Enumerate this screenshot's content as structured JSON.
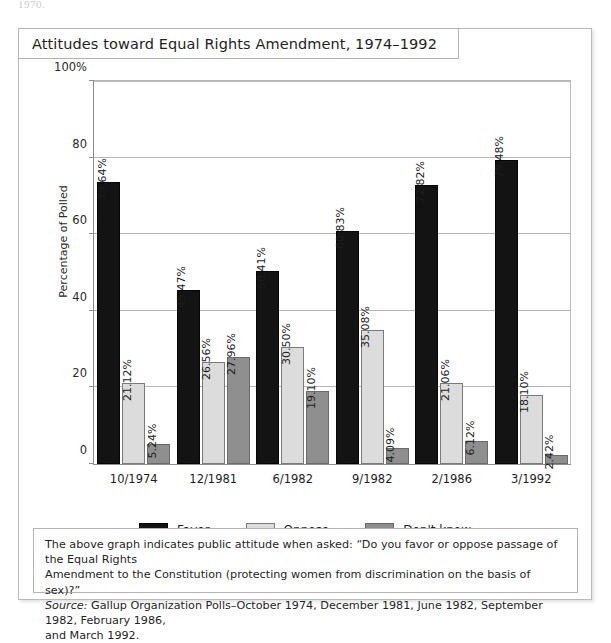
{
  "page_fragment": "1970.",
  "figure": {
    "title": "Attitudes toward Equal Rights Amendment, 1974–1992"
  },
  "legend": {
    "items": [
      {
        "label": "Favor",
        "color": "#131313",
        "swatch": "favor"
      },
      {
        "label": "Oppose",
        "color": "#dcdcdc",
        "swatch": "oppose"
      },
      {
        "label": "Don't know",
        "color": "#8f8f8f",
        "swatch": "dontknow"
      }
    ]
  },
  "caption": {
    "line1": "The above graph indicates public attitude when asked: “Do you favor or oppose passage of the Equal Rights",
    "line2": "Amendment to the Constitution (protecting women from discrimination on the basis of sex)?”",
    "source_word": "Source:",
    "line3": " Gallup Organization Polls–October 1974, December 1981, June 1982, September 1982, February 1986,",
    "line4": "and March 1992."
  },
  "chart_data": {
    "type": "bar",
    "title": "Attitudes toward Equal Rights Amendment, 1974–1992",
    "xlabel": "",
    "ylabel": "Percentage of Polled",
    "ylim": [
      0,
      100
    ],
    "yticks": [
      0,
      20,
      40,
      60,
      80,
      100
    ],
    "ytick_labels": [
      "0",
      "20",
      "40",
      "60",
      "80",
      "100%"
    ],
    "grid": true,
    "legend_position": "bottom",
    "categories": [
      "10/1974",
      "12/1981",
      "6/1982",
      "9/1982",
      "2/1986",
      "3/1992"
    ],
    "series": [
      {
        "name": "Favor",
        "color": "#131313",
        "values": [
          73.64,
          45.47,
          50.41,
          60.83,
          72.82,
          79.48
        ],
        "labels": [
          "73.64%",
          "45.47%",
          "50.41%",
          "60.83%",
          "72.82%",
          "79.48%"
        ]
      },
      {
        "name": "Oppose",
        "color": "#dcdcdc",
        "values": [
          21.12,
          26.56,
          30.5,
          35.08,
          21.06,
          18.1
        ],
        "labels": [
          "21.12%",
          "26.56%",
          "30.50%",
          "35.08%",
          "21.06%",
          "18.10%"
        ]
      },
      {
        "name": "Don't know",
        "color": "#8f8f8f",
        "values": [
          5.24,
          27.96,
          19.1,
          4.09,
          6.12,
          2.42
        ],
        "labels": [
          "5.24%",
          "27.96%",
          "19.10%",
          "4.09%",
          "6.12%",
          "2.42%"
        ]
      }
    ]
  }
}
